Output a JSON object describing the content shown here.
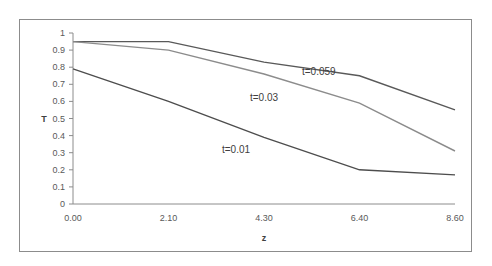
{
  "chart_data": {
    "type": "line",
    "title": "",
    "xlabel": "z",
    "ylabel": "T",
    "x": [
      "0.00",
      "2.10",
      "4.30",
      "6.40",
      "8.60"
    ],
    "ylim": [
      0,
      1
    ],
    "yticks": [
      "0",
      "0.1",
      "0.2",
      "0.3",
      "0.4",
      "0.5",
      "0.6",
      "0.7",
      "0.8",
      "0.9",
      "1"
    ],
    "grid": false,
    "legend": "inline labels",
    "series": [
      {
        "name": "t=0.059",
        "values": [
          0.95,
          0.95,
          0.83,
          0.75,
          0.55
        ],
        "color": "#595959"
      },
      {
        "name": "t=0.03",
        "values": [
          0.95,
          0.9,
          0.76,
          0.59,
          0.31
        ],
        "color": "#8c8c8c"
      },
      {
        "name": "t=0.01",
        "values": [
          0.79,
          0.6,
          0.39,
          0.2,
          0.17
        ],
        "color": "#4d4d4d"
      }
    ],
    "annotations": [
      {
        "text": "t=0.059",
        "x_px": 302,
        "y_px": 75
      },
      {
        "text": "t=0.03",
        "x_px": 250,
        "y_px": 101
      },
      {
        "text": "t=0.01",
        "x_px": 222,
        "y_px": 153
      }
    ]
  }
}
